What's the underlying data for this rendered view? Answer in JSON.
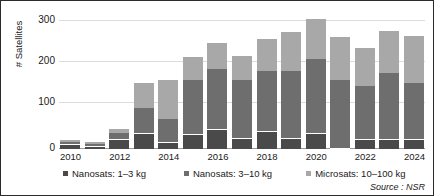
{
  "chart_data": {
    "type": "bar",
    "stacked": true,
    "title": "",
    "subtitle": "",
    "xlabel": "",
    "ylabel": "# Satellites",
    "ylim": [
      0,
      330
    ],
    "yticks": [
      0,
      100,
      200,
      300
    ],
    "ytick_labels": [
      "0",
      "100",
      "200",
      "300"
    ],
    "grid": true,
    "legend_position": "bottom",
    "source": "Source : NSR",
    "x": [
      2010,
      2011,
      2012,
      2013,
      2014,
      2015,
      2016,
      2017,
      2018,
      2019,
      2020,
      2021,
      2022,
      2023,
      2024
    ],
    "categories": [
      "2010",
      "2011",
      "2012",
      "2013",
      "2014",
      "2015",
      "2016",
      "2017",
      "2018",
      "2019",
      "2020",
      "2021",
      "2022",
      "2023",
      "2024"
    ],
    "xtick_labels": [
      "2010",
      "",
      "2012",
      "",
      "2014",
      "",
      "2016",
      "",
      "2018",
      "",
      "2020",
      "",
      "2022",
      "",
      "2024"
    ],
    "series": [
      {
        "name": "Nanosats: 1–3 kg",
        "color": "#4a4a4a",
        "values": [
          10,
          6,
          22,
          38,
          16,
          34,
          46,
          25,
          43,
          24,
          37,
          0,
          22,
          21,
          23
        ]
      },
      {
        "name": "Nanosats: 3–10 kg",
        "color": "#6e6e6e",
        "values": [
          7,
          6,
          18,
          62,
          57,
          135,
          152,
          144,
          149,
          168,
          184,
          171,
          134,
          165,
          139
        ]
      },
      {
        "name": "Microsats: 10–100 kg",
        "color": "#a8a8a8",
        "values": [
          5,
          6,
          10,
          62,
          98,
          58,
          62,
          61,
          80,
          96,
          99,
          105,
          93,
          105,
          117
        ]
      }
    ],
    "totals": [
      22,
      18,
      50,
      162,
      171,
      227,
      260,
      230,
      272,
      288,
      320,
      276,
      249,
      291,
      279
    ]
  },
  "legend": {
    "items": [
      {
        "label": "Nanosats: 1–3 kg",
        "color": "#4a4a4a"
      },
      {
        "label": "Nanosats: 3–10 kg",
        "color": "#6e6e6e"
      },
      {
        "label": "Microsats: 10–100 kg",
        "color": "#a8a8a8"
      }
    ]
  },
  "axes": {
    "y_title": "# Satellites",
    "y_labels": [
      "300",
      "200",
      "100",
      "0"
    ]
  },
  "footer": {
    "source": "Source : NSR"
  }
}
